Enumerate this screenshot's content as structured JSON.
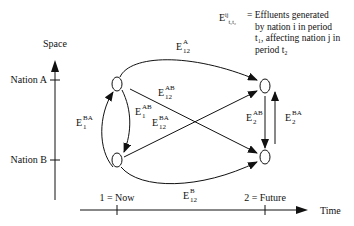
{
  "axes": {
    "vertical": {
      "label": "Space",
      "ticks": [
        "Nation A",
        "Nation B"
      ]
    },
    "horizontal": {
      "label": "Time",
      "ticks": [
        "1 = Now",
        "2 = Future"
      ]
    }
  },
  "nodes": [
    {
      "id": "A1",
      "nation": "Nation A",
      "period": "1"
    },
    {
      "id": "B1",
      "nation": "Nation B",
      "period": "1"
    },
    {
      "id": "A2",
      "nation": "Nation A",
      "period": "2"
    },
    {
      "id": "B2",
      "nation": "Nation B",
      "period": "2"
    }
  ],
  "edges": [
    {
      "from": "A1",
      "to": "A2",
      "base": "E",
      "sup": "A",
      "sub": "12"
    },
    {
      "from": "B1",
      "to": "B2",
      "base": "E",
      "sup": "B",
      "sub": "12"
    },
    {
      "from": "A1",
      "to": "B2",
      "base": "E",
      "sup": "AB",
      "sub": "12"
    },
    {
      "from": "B1",
      "to": "A2",
      "base": "E",
      "sup": "BA",
      "sub": "12"
    },
    {
      "from": "A1",
      "to": "B1",
      "base": "E",
      "sup": "AB",
      "sub": "1"
    },
    {
      "from": "B1",
      "to": "A1",
      "base": "E",
      "sup": "BA",
      "sub": "1"
    },
    {
      "from": "A2",
      "to": "B2",
      "base": "E",
      "sup": "AB",
      "sub": "2"
    },
    {
      "from": "B2",
      "to": "A2",
      "base": "E",
      "sup": "BA",
      "sub": "2"
    }
  ],
  "legend": {
    "symbol": {
      "base": "E",
      "sup": "ij",
      "sub": "t₁t₂"
    },
    "lines": [
      "= Effluents  generated",
      "by nation i in period",
      "t₁, affecting nation j in",
      "period  t₂"
    ]
  }
}
